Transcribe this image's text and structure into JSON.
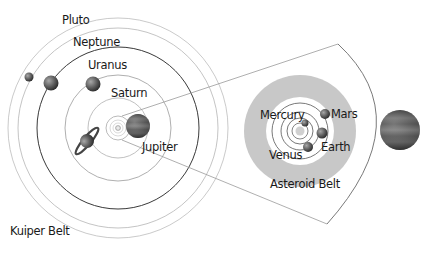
{
  "diagram": {
    "outer_system": {
      "labels": {
        "pluto": "Pluto",
        "neptune": "Neptune",
        "uranus": "Uranus",
        "saturn": "Saturn",
        "jupiter": "Jupiter",
        "kuiper_belt": "Kuiper Belt"
      }
    },
    "inner_system": {
      "labels": {
        "mercury": "Mercury",
        "venus": "Venus",
        "earth": "Earth",
        "mars": "Mars",
        "asteroid_belt": "Asteroid Belt"
      }
    },
    "colors": {
      "asteroid_belt": "#c8c8c8",
      "dark_orbit": "#333333",
      "light_orbit": "#b0b0b0",
      "planet": "#555555"
    }
  }
}
